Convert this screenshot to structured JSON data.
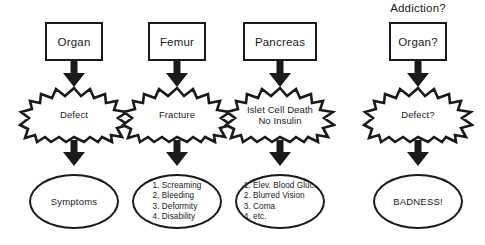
{
  "diagram": {
    "title": "",
    "colors": {
      "stroke": "#1a1a1a",
      "fill": "#ffffff",
      "background": "#ffffff"
    },
    "columns": [
      {
        "column_title": "",
        "box_label": "Organ",
        "burst_lines": [
          "Defect"
        ],
        "oval_text": "Symptoms",
        "oval_items": []
      },
      {
        "column_title": "",
        "box_label": "Femur",
        "burst_lines": [
          "Fracture"
        ],
        "oval_text": "",
        "oval_items": [
          "1. Screaming",
          "2. Bleeding",
          "3. Deformity",
          "4. Disability"
        ]
      },
      {
        "column_title": "",
        "box_label": "Pancreas",
        "burst_lines": [
          "Islet Cell Death",
          "No Insulin"
        ],
        "oval_text": "",
        "oval_items": [
          "1. Elev. Blood Gluc.",
          "2. Blurred Vision",
          "3. Coma",
          "4. etc."
        ]
      },
      {
        "column_title": "Addiction?",
        "box_label": "Organ?",
        "burst_lines": [
          "Defect?"
        ],
        "oval_text": "BADNESS!",
        "oval_items": []
      }
    ]
  }
}
